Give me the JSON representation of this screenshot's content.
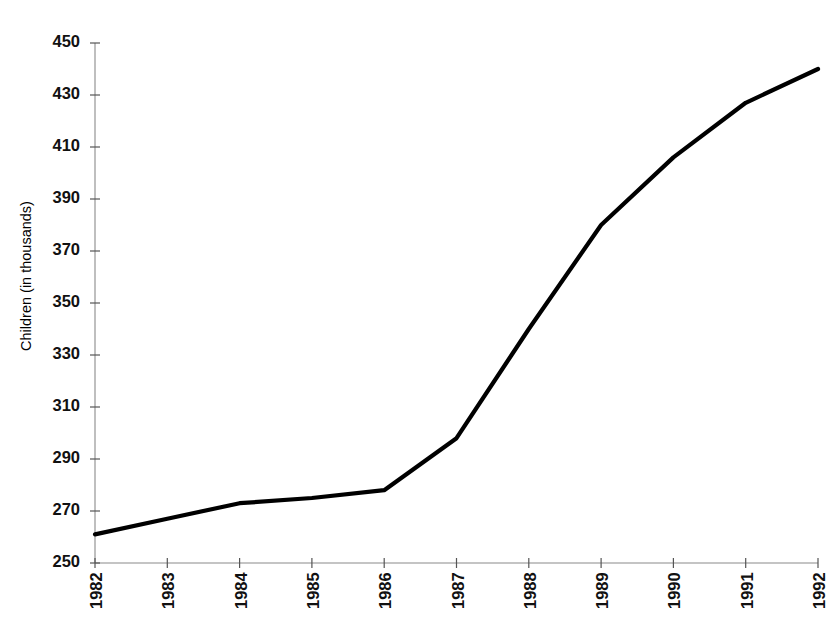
{
  "chart_data": {
    "type": "line",
    "title": "",
    "xlabel": "",
    "ylabel": "Children (in thousands)",
    "categories": [
      "1982",
      "1983",
      "1984",
      "1985",
      "1986",
      "1987",
      "1988",
      "1989",
      "1990",
      "1991",
      "1992"
    ],
    "values": [
      261,
      267,
      273,
      275,
      278,
      298,
      340,
      380,
      406,
      427,
      440
    ],
    "series": [
      {
        "name": "Children",
        "values": [
          261,
          267,
          273,
          275,
          278,
          298,
          340,
          380,
          406,
          427,
          440
        ]
      }
    ],
    "ylim": [
      250,
      450
    ],
    "ytick_step": 20,
    "yticks": [
      450,
      430,
      410,
      390,
      370,
      350,
      330,
      310,
      290,
      270,
      250
    ],
    "xticks": [
      "1982",
      "1983",
      "1984",
      "1985",
      "1986",
      "1987",
      "1988",
      "1989",
      "1990",
      "1991",
      "1992"
    ],
    "grid": false,
    "legend": false,
    "legend_position": "none",
    "line_color": "#000000",
    "axis_color": "#808080",
    "background_color": "#ffffff",
    "x_label_rotation": -90
  },
  "axes": {
    "y_axis_title": "Children (in thousands)",
    "y_tick_labels": [
      "450",
      "430",
      "410",
      "390",
      "370",
      "350",
      "330",
      "310",
      "290",
      "270",
      "250"
    ],
    "x_tick_labels": [
      "1982",
      "1983",
      "1984",
      "1985",
      "1986",
      "1987",
      "1988",
      "1989",
      "1990",
      "1991",
      "1992"
    ]
  }
}
